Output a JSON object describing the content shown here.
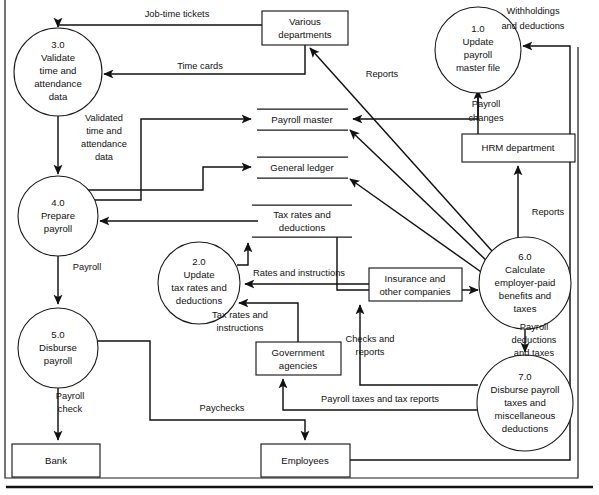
{
  "diagram": {
    "type": "data-flow-diagram",
    "colors": {
      "ink": "#111111",
      "paper": "#ffffff",
      "stroke": "#1a1a1a"
    }
  },
  "processes": [
    {
      "id": "p1",
      "label": "1.0\nUpdate\npayroll\nmaster file",
      "lines": [
        "1.0",
        "Update",
        "payroll",
        "master file"
      ],
      "cx": 478,
      "cy": 50,
      "r": 43
    },
    {
      "id": "p2",
      "label": "2.0\nUpdate\ntax rates and\ndeductions",
      "lines": [
        "2.0",
        "Update",
        "tax rates and",
        "deductions"
      ],
      "cx": 199,
      "cy": 283,
      "r": 41
    },
    {
      "id": "p3",
      "label": "3.0\nValidate\ntime and\nattendance\ndata",
      "lines": [
        "3.0",
        "Validate",
        "time and",
        "attendance",
        "data"
      ],
      "cx": 58,
      "cy": 72,
      "r": 44
    },
    {
      "id": "p4",
      "label": "4.0\nPrepare\npayroll",
      "lines": [
        "4.0",
        "Prepare",
        "payroll"
      ],
      "cx": 58,
      "cy": 216,
      "r": 40
    },
    {
      "id": "p5",
      "label": "5.0\nDisburse\npayroll",
      "lines": [
        "5.0",
        "Disburse",
        "payroll"
      ],
      "cx": 58,
      "cy": 348,
      "r": 40
    },
    {
      "id": "p6",
      "label": "6.0\nCalculate\nemployer-paid\nbenefits and\ntaxes",
      "lines": [
        "6.0",
        "Calculate",
        "employer-paid",
        "benefits and",
        "taxes"
      ],
      "cx": 525,
      "cy": 283,
      "r": 46
    },
    {
      "id": "p7",
      "label": "7.0\nDisburse payroll\ntaxes and\nmiscellaneous\ndeductions",
      "lines": [
        "7.0",
        "Disburse payroll",
        "taxes and",
        "miscellaneous",
        "deductions"
      ],
      "cx": 525,
      "cy": 403,
      "r": 48
    }
  ],
  "entities": [
    {
      "id": "e-various",
      "lines": [
        "Various",
        "departments"
      ],
      "x": 262,
      "y": 11,
      "w": 86,
      "h": 34
    },
    {
      "id": "e-hrm",
      "lines": [
        "HRM department"
      ],
      "x": 462,
      "y": 134,
      "w": 113,
      "h": 28
    },
    {
      "id": "e-insurance",
      "lines": [
        "Insurance and",
        "other companies"
      ],
      "x": 369,
      "y": 268,
      "w": 93,
      "h": 33
    },
    {
      "id": "e-government",
      "lines": [
        "Government",
        "agencies"
      ],
      "x": 256,
      "y": 342,
      "w": 85,
      "h": 33
    },
    {
      "id": "e-bank",
      "lines": [
        "Bank"
      ],
      "x": 12,
      "y": 444,
      "w": 88,
      "h": 33
    },
    {
      "id": "e-employees",
      "lines": [
        "Employees"
      ],
      "x": 261,
      "y": 444,
      "w": 89,
      "h": 33
    }
  ],
  "datastores": [
    {
      "id": "ds-payroll-master",
      "label": "Payroll master",
      "x": 257,
      "y": 109,
      "w": 91,
      "h": 21
    },
    {
      "id": "ds-general-ledger",
      "label": "General ledger",
      "x": 257,
      "y": 157,
      "w": 91,
      "h": 21
    },
    {
      "id": "ds-tax-rates",
      "lines": [
        "Tax rates and",
        "deductions"
      ],
      "label": "Tax rates and deductions",
      "x": 252,
      "y": 205,
      "w": 100,
      "h": 32
    }
  ],
  "flows": [
    {
      "id": "f-job-time-tickets",
      "label": "Job-time tickets",
      "lx": 177,
      "ly": 15
    },
    {
      "id": "f-time-cards",
      "label": "Time cards",
      "lx": 200,
      "ly": 73
    },
    {
      "id": "f-validated-data",
      "lines": [
        "Validated",
        "time and",
        "attendance",
        "data"
      ],
      "lx": 100,
      "ly": 124
    },
    {
      "id": "f-payroll",
      "label": "Payroll",
      "lx": 84,
      "ly": 268
    },
    {
      "id": "f-payroll-check",
      "lines": [
        "Payroll",
        "check"
      ],
      "lx": 84,
      "ly": 400
    },
    {
      "id": "f-paychecks",
      "label": "Paychecks",
      "lx": 222,
      "ly": 409
    },
    {
      "id": "f-reports-dept",
      "label": "Reports",
      "lx": 382,
      "ly": 75
    },
    {
      "id": "f-withholdings",
      "lines": [
        "Withholdings",
        "and deductions"
      ],
      "lx": 533,
      "ly": 16
    },
    {
      "id": "f-payroll-changes",
      "lines": [
        "Payroll",
        "changes"
      ],
      "lx": 494,
      "ly": 110
    },
    {
      "id": "f-reports-hrm",
      "label": "Reports",
      "lx": 542,
      "ly": 213
    },
    {
      "id": "f-rates-instructions",
      "label": "Rates and instructions",
      "lx": 299,
      "ly": 279
    },
    {
      "id": "f-tax-rates-instructions",
      "lines": [
        "Tax rates and",
        "instructions"
      ],
      "lx": 268,
      "ly": 322
    },
    {
      "id": "f-checks-reports",
      "lines": [
        "Checks and",
        "reports"
      ],
      "lx": 383,
      "ly": 341
    },
    {
      "id": "f-payroll-deductions-taxes",
      "lines": [
        "Payroll",
        "deductions",
        "and taxes"
      ],
      "lx": 556,
      "ly": 340
    },
    {
      "id": "f-payroll-taxes-reports",
      "label": "Payroll taxes and tax reports",
      "lx": 398,
      "ly": 400
    }
  ]
}
